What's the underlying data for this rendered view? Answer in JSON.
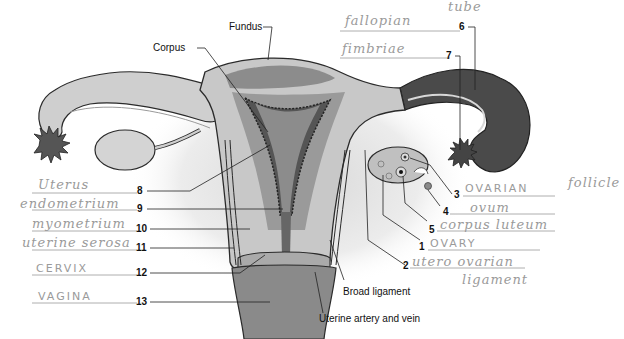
{
  "diagram": {
    "printed_labels": {
      "fundus": "Fundus",
      "corpus": "Corpus",
      "broad_ligament": "Broad ligament",
      "uterine_artery_vein": "Uterine artery and vein"
    },
    "numbered_blanks": [
      {
        "number": "1",
        "answer": "OVARY"
      },
      {
        "number": "2",
        "answer": "utero ovarian",
        "answer_line2": "ligament"
      },
      {
        "number": "3",
        "answer": "OVARIAN",
        "answer_extra": "follicle"
      },
      {
        "number": "4",
        "answer": "ovum"
      },
      {
        "number": "5",
        "answer": "corpus luteum"
      },
      {
        "number": "6",
        "answer": "fallopian",
        "answer_extra": "tube"
      },
      {
        "number": "7",
        "answer": "fimbriae"
      },
      {
        "number": "8",
        "answer": "Uterus"
      },
      {
        "number": "9",
        "answer": "endometrium"
      },
      {
        "number": "10",
        "answer": "myometrium"
      },
      {
        "number": "11",
        "answer": "uterine serosa"
      },
      {
        "number": "12",
        "answer": "CERVIX"
      },
      {
        "number": "13",
        "answer": "VAGINA"
      }
    ],
    "colors": {
      "outline": "#2a2a2a",
      "tube_dark": "#4a4a4a",
      "tissue_mid": "#8c8c8c",
      "tissue_light": "#c8c8c8",
      "tissue_pale": "#e2e2e2",
      "background_shadow": "#eeeeee",
      "handwriting": "#9a9a9a"
    }
  }
}
